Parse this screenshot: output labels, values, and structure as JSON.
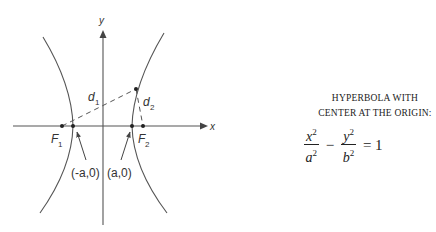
{
  "diagram": {
    "axis_labels": {
      "x": "x",
      "y": "y"
    },
    "foci": [
      {
        "label": "F",
        "subscript": "1"
      },
      {
        "label": "F",
        "subscript": "2"
      }
    ],
    "distances": [
      {
        "label": "d",
        "subscript": "1"
      },
      {
        "label": "d",
        "subscript": "2"
      }
    ],
    "vertices": [
      {
        "label": "(-a,0)"
      },
      {
        "label": "(a,0)"
      }
    ],
    "stroke_color": "#555555"
  },
  "caption": {
    "line1": "HYPERBOLA WITH",
    "line2": "CENTER AT THE ORIGIN:",
    "equation": {
      "term1_num": "x",
      "term1_den": "a",
      "term2_num": "y",
      "term2_den": "b",
      "exponent": "2",
      "minus": "−",
      "equals": "= 1"
    }
  }
}
